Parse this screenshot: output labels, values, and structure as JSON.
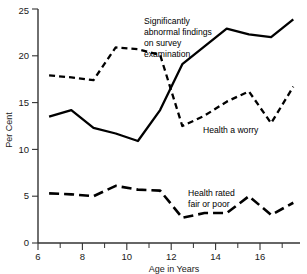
{
  "chart_data": {
    "type": "line",
    "title": "",
    "xlabel": "Age in Years",
    "ylabel": "Per Cent",
    "xlim": [
      6,
      17.8
    ],
    "ylim": [
      0,
      25
    ],
    "grid": false,
    "legend_position": "inline-annotations",
    "xticks_major": [
      6,
      8,
      10,
      12,
      14,
      16
    ],
    "xticks_minor": [
      7,
      9,
      11,
      13,
      15,
      17
    ],
    "yticks": [
      0,
      5,
      10,
      15,
      20,
      25
    ],
    "x": [
      6.5,
      7.5,
      8.5,
      9.5,
      10.5,
      11.5,
      12.5,
      13.5,
      14.5,
      15.5,
      16.5,
      17.5
    ],
    "series": [
      {
        "name": "Significantly abnormal findings on survey examination",
        "style": "solid",
        "values": [
          13.5,
          14.2,
          12.3,
          11.7,
          10.9,
          14.2,
          19.1,
          21.0,
          22.9,
          22.3,
          22.0,
          23.9
        ]
      },
      {
        "name": "Health a worry",
        "style": "short-dashed",
        "values": [
          17.9,
          17.7,
          17.4,
          20.9,
          20.7,
          20.1,
          12.5,
          13.6,
          15.1,
          16.2,
          12.8,
          16.7
        ]
      },
      {
        "name": "Health rated fair or poor",
        "style": "long-dashed",
        "values": [
          5.3,
          5.2,
          5.0,
          6.1,
          5.7,
          5.6,
          2.7,
          3.2,
          3.2,
          5.0,
          3.0,
          4.3
        ]
      }
    ],
    "annotations": [
      {
        "id": "survey-findings",
        "lines": [
          "Significantly",
          "abnormal findings",
          "on survey",
          "examination"
        ]
      },
      {
        "id": "health-worry",
        "lines": [
          "Health a worry"
        ]
      },
      {
        "id": "health-fair-poor",
        "lines": [
          "Health rated",
          "fair or poor"
        ]
      }
    ],
    "tick_labels": {
      "y": [
        "0",
        "5",
        "10",
        "15",
        "20",
        "25"
      ],
      "x": [
        "6",
        "8",
        "10",
        "12",
        "14",
        "16"
      ]
    }
  }
}
